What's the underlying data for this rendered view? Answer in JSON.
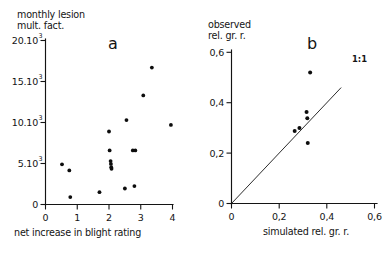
{
  "figure": {
    "background": "#ffffff",
    "ink_color": "#141414",
    "point_color": "#0d0d0d"
  },
  "chart_data": [
    {
      "type": "scatter",
      "panel": "a",
      "panel_label": "a",
      "title": "",
      "xlabel": "net increase in blight rating",
      "ylabel": "monthly lesion mult. fact.",
      "ylabel_line1": "monthly lesion",
      "ylabel_line2": "mult. fact.",
      "xlim": [
        0,
        4
      ],
      "ylim": [
        0,
        20000
      ],
      "xticks": [
        0,
        1,
        2,
        3,
        4
      ],
      "xticklabels": [
        "0",
        "1",
        "2",
        "3",
        "4"
      ],
      "yticks": [
        0,
        5000,
        10000,
        15000,
        20000
      ],
      "yticklabels": [
        "0",
        "5.10",
        "10.10",
        "15.10",
        "20.10"
      ],
      "ytick_exponent": "3",
      "grid": false,
      "legend": false,
      "points": [
        {
          "x": 0.52,
          "y": 4900
        },
        {
          "x": 0.75,
          "y": 4150
        },
        {
          "x": 0.78,
          "y": 900
        },
        {
          "x": 1.7,
          "y": 1500
        },
        {
          "x": 2.0,
          "y": 8900
        },
        {
          "x": 2.02,
          "y": 6600
        },
        {
          "x": 2.05,
          "y": 5300
        },
        {
          "x": 2.06,
          "y": 4950
        },
        {
          "x": 2.07,
          "y": 4550
        },
        {
          "x": 2.08,
          "y": 4350
        },
        {
          "x": 2.5,
          "y": 1950
        },
        {
          "x": 2.55,
          "y": 10300
        },
        {
          "x": 2.75,
          "y": 6600
        },
        {
          "x": 2.83,
          "y": 6600
        },
        {
          "x": 2.8,
          "y": 2250
        },
        {
          "x": 3.08,
          "y": 13300
        },
        {
          "x": 3.35,
          "y": 16700
        },
        {
          "x": 3.95,
          "y": 9700
        }
      ]
    },
    {
      "type": "scatter",
      "panel": "b",
      "panel_label": "b",
      "title": "",
      "xlabel": "simulated rel. gr. r.",
      "ylabel": "observed rel. gr. r.",
      "ylabel_line1": "observed",
      "ylabel_line2": "rel. gr. r.",
      "xlim": [
        0,
        0.6
      ],
      "ylim": [
        0,
        0.6
      ],
      "xticks": [
        0,
        0.2,
        0.4,
        0.6
      ],
      "xticklabels": [
        "0",
        "0,2",
        "0,4",
        "0,6"
      ],
      "yticks": [
        0,
        0.2,
        0.4,
        0.6
      ],
      "yticklabels": [
        "0",
        "0,2",
        "0,4",
        "0,6"
      ],
      "grid": false,
      "legend": false,
      "reference_line": {
        "label": "1:1",
        "slope": 1,
        "intercept": 0,
        "from": [
          0,
          0
        ],
        "to": [
          0.46,
          0.46
        ]
      },
      "points": [
        {
          "x": 0.265,
          "y": 0.288
        },
        {
          "x": 0.285,
          "y": 0.3
        },
        {
          "x": 0.315,
          "y": 0.363
        },
        {
          "x": 0.318,
          "y": 0.338
        },
        {
          "x": 0.32,
          "y": 0.24
        },
        {
          "x": 0.33,
          "y": 0.52
        }
      ]
    }
  ]
}
